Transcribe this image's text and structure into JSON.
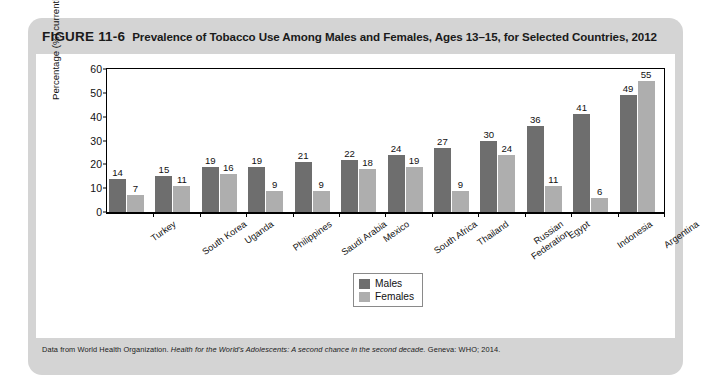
{
  "figure": {
    "number": "FIGURE 11-6",
    "caption": "Prevalence of Tobacco Use Among Males and Females, Ages 13–15, for Selected Countries, 2012",
    "source_prefix": "Data from World Health Organization. ",
    "source_italic": "Health for the World's Adolescents: A second chance in the second decade.",
    "source_suffix": " Geneva: WHO; 2014."
  },
  "colors": {
    "card_background": "#d4d4d4",
    "plot_background": "#ffffff",
    "males_bar": "#6e6e6e",
    "females_bar": "#aeaeae",
    "axis": "#000000"
  },
  "chart_data": {
    "type": "bar",
    "title": "Prevalence of Tobacco Use Among Males and Females, Ages 13–15, for Selected Countries, 2012",
    "xlabel": "",
    "ylabel": "Percentage (%) currently using any form of tobacco",
    "ylim": [
      0,
      60
    ],
    "yticks": [
      0,
      10,
      20,
      30,
      40,
      50,
      60
    ],
    "grid": false,
    "legend_position": "bottom-center",
    "categories": [
      "Turkey",
      "South Korea",
      "Uganda",
      "Philippines",
      "Saudi Arabia",
      "Mexico",
      "South Africa",
      "Thailand",
      "Russian\nFederation",
      "Egypt",
      "Indonesia",
      "Argentina"
    ],
    "series": [
      {
        "name": "Males",
        "values": [
          14,
          15,
          19,
          19,
          21,
          22,
          24,
          27,
          30,
          36,
          41,
          49
        ]
      },
      {
        "name": "Females",
        "values": [
          7,
          11,
          16,
          9,
          9,
          18,
          19,
          9,
          24,
          11,
          6,
          55
        ]
      }
    ]
  }
}
